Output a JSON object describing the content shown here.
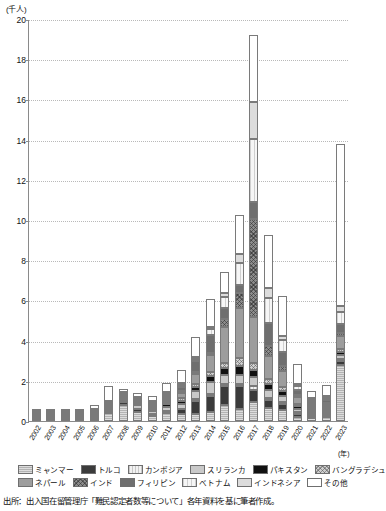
{
  "axis": {
    "y_unit_label": "(千人)",
    "x_unit_label": "(年)",
    "y_ticks": [
      "20",
      "18",
      "16",
      "14",
      "12",
      "10",
      "8",
      "6",
      "4",
      "2",
      "0"
    ]
  },
  "legend": {
    "row1": [
      {
        "label": "ミャンマー",
        "key": "myanmar"
      },
      {
        "label": "トルコ",
        "key": "turkey"
      },
      {
        "label": "カンボジア",
        "key": "cambodia"
      },
      {
        "label": "スリランカ",
        "key": "srilanka"
      },
      {
        "label": "パキスタン",
        "key": "pakistan"
      },
      {
        "label": "バングラデシュ",
        "key": "bangladesh"
      }
    ],
    "row2": [
      {
        "label": "ネパール",
        "key": "nepal"
      },
      {
        "label": "インド",
        "key": "india"
      },
      {
        "label": "フィリピン",
        "key": "philippines"
      },
      {
        "label": "ベトナム",
        "key": "vietnam"
      },
      {
        "label": "インドネシア",
        "key": "indonesia"
      },
      {
        "label": "その他",
        "key": "other"
      }
    ]
  },
  "source": "出所：出入国在留管理庁「難民認定者数等について」各年資料を基に筆者作成。",
  "chart_data": {
    "type": "bar",
    "stacked": true,
    "title": "",
    "xlabel": "(年)",
    "ylabel": "(千人)",
    "ylim": [
      0,
      20
    ],
    "ytick_step": 2,
    "grid": true,
    "legend_position": "bottom",
    "categories": [
      "2002",
      "2003",
      "2004",
      "2005",
      "2006",
      "2007",
      "2008",
      "2009",
      "2010",
      "2011",
      "2012",
      "2013",
      "2014",
      "2015",
      "2016",
      "2017",
      "2018",
      "2019",
      "2020",
      "2021",
      "2022",
      "2023"
    ],
    "series": [
      {
        "name": "ミャンマー",
        "key": "myanmar",
        "values": [
          0.06,
          0.11,
          0.1,
          0.08,
          0.13,
          0.5,
          0.98,
          0.57,
          0.34,
          0.49,
          0.37,
          0.38,
          0.43,
          0.81,
          0.59,
          0.96,
          0.63,
          0.55,
          0.22,
          0.17,
          0.22,
          2.82
        ]
      },
      {
        "name": "トルコ",
        "key": "turkey",
        "values": [
          0.01,
          0.02,
          0.02,
          0.02,
          0.04,
          0.07,
          0.16,
          0.15,
          0.13,
          0.16,
          0.29,
          0.66,
          0.85,
          0.93,
          1.14,
          0.6,
          0.42,
          0.32,
          0.15,
          0.09,
          0.09,
          0.19
        ]
      },
      {
        "name": "カンボジア",
        "key": "cambodia",
        "values": [
          0.0,
          0.0,
          0.0,
          0.0,
          0.0,
          0.0,
          0.0,
          0.0,
          0.0,
          0.0,
          0.0,
          0.01,
          0.04,
          0.07,
          0.1,
          0.16,
          0.1,
          0.06,
          0.02,
          0.01,
          0.01,
          0.02
        ]
      },
      {
        "name": "スリランカ",
        "key": "srilanka",
        "values": [
          0.01,
          0.02,
          0.03,
          0.03,
          0.05,
          0.12,
          0.09,
          0.23,
          0.17,
          0.22,
          0.26,
          0.41,
          0.6,
          0.45,
          0.48,
          0.49,
          0.38,
          0.28,
          0.15,
          0.07,
          0.07,
          0.19
        ]
      },
      {
        "name": "パキスタン",
        "key": "pakistan",
        "values": [
          0.01,
          0.01,
          0.01,
          0.02,
          0.03,
          0.06,
          0.09,
          0.09,
          0.11,
          0.14,
          0.17,
          0.23,
          0.29,
          0.35,
          0.44,
          0.35,
          0.29,
          0.24,
          0.13,
          0.06,
          0.06,
          0.15
        ]
      },
      {
        "name": "バングラデシュ",
        "key": "bangladesh",
        "values": [
          0.01,
          0.01,
          0.01,
          0.01,
          0.02,
          0.04,
          0.06,
          0.06,
          0.08,
          0.1,
          0.12,
          0.16,
          0.2,
          0.28,
          0.38,
          0.32,
          0.26,
          0.2,
          0.1,
          0.05,
          0.06,
          0.16
        ]
      },
      {
        "name": "ネパール",
        "key": "nepal",
        "values": [
          0.0,
          0.0,
          0.0,
          0.0,
          0.01,
          0.02,
          0.03,
          0.05,
          0.07,
          0.14,
          0.32,
          0.54,
          0.85,
          1.77,
          2.48,
          2.28,
          1.14,
          0.79,
          0.35,
          0.14,
          0.16,
          0.65
        ]
      },
      {
        "name": "インド",
        "key": "india",
        "values": [
          0.0,
          0.0,
          0.0,
          0.0,
          0.0,
          0.0,
          0.0,
          0.0,
          0.0,
          0.01,
          0.02,
          0.03,
          0.11,
          0.41,
          0.75,
          4.88,
          0.5,
          0.27,
          0.1,
          0.04,
          0.04,
          0.16
        ]
      },
      {
        "name": "フィリピン",
        "key": "philippines",
        "values": [
          0.0,
          0.0,
          0.0,
          0.0,
          0.0,
          0.01,
          0.01,
          0.02,
          0.03,
          0.05,
          0.18,
          0.53,
          0.88,
          0.53,
          0.43,
          0.87,
          1.15,
          0.72,
          0.3,
          0.12,
          0.13,
          0.45
        ]
      },
      {
        "name": "ベトナム",
        "key": "vietnam",
        "values": [
          0.0,
          0.0,
          0.0,
          0.0,
          0.0,
          0.0,
          0.0,
          0.0,
          0.01,
          0.02,
          0.05,
          0.12,
          0.29,
          0.57,
          1.07,
          3.12,
          1.24,
          0.57,
          0.2,
          0.09,
          0.1,
          0.6
        ]
      },
      {
        "name": "インドネシア",
        "key": "indonesia",
        "values": [
          0.0,
          0.0,
          0.0,
          0.0,
          0.0,
          0.0,
          0.0,
          0.0,
          0.0,
          0.01,
          0.02,
          0.05,
          0.13,
          0.21,
          0.44,
          1.84,
          0.5,
          0.24,
          0.08,
          0.03,
          0.04,
          0.26
        ]
      },
      {
        "name": "その他",
        "key": "other",
        "values": [
          0.15,
          0.19,
          0.26,
          0.23,
          0.54,
          0.91,
          0.17,
          0.24,
          0.29,
          0.53,
          0.75,
          1.08,
          1.38,
          1.02,
          1.95,
          3.33,
          2.63,
          1.98,
          1.06,
          0.63,
          0.81,
          8.13
        ]
      }
    ],
    "totals": [
      0.25,
      0.36,
      0.43,
      0.39,
      0.82,
      1.73,
      1.59,
      1.41,
      1.23,
      1.87,
      2.55,
      4.2,
      6.05,
      7.4,
      10.25,
      20.2,
      9.04,
      6.22,
      2.86,
      1.5,
      1.79,
      13.78
    ],
    "peak": {
      "year": "2017",
      "value": 18.2
    },
    "second_peak": {
      "year": "2023",
      "value": 13.8
    }
  }
}
